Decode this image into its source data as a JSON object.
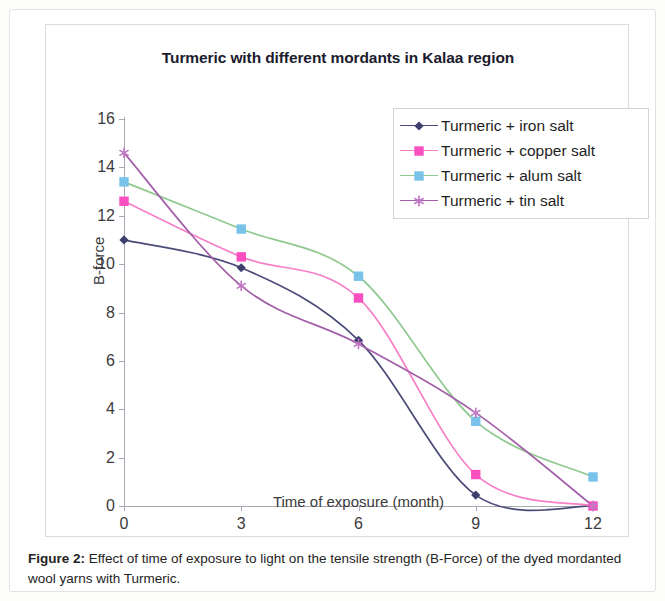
{
  "figure": {
    "caption_label": "Figure 2:",
    "caption_text": " Effect of time of exposure to light on the tensile strength (B-Force) of the dyed mordanted wool yarns with Turmeric."
  },
  "chart_data": {
    "type": "line",
    "title": "Turmeric with different mordants in Kalaa region",
    "xlabel": "Time of exposure (month)",
    "ylabel": "B-force",
    "x": [
      0,
      3,
      6,
      9,
      12
    ],
    "xticks": [
      "0",
      "3",
      "6",
      "9",
      "12"
    ],
    "yticks": [
      "0",
      "2",
      "4",
      "6",
      "8",
      "10",
      "12",
      "14",
      "16"
    ],
    "xlim": [
      0,
      12
    ],
    "ylim": [
      0,
      16
    ],
    "grid": false,
    "legend_position": "top-right-inside",
    "series": [
      {
        "name": "Turmeric + iron salt",
        "color": "#4a4a78",
        "marker": "diamond",
        "marker_color": "#3f3f6e",
        "values": [
          11.0,
          9.85,
          6.85,
          0.45,
          0.0
        ]
      },
      {
        "name": "Turmeric + copper salt",
        "color": "#f77fc8",
        "marker": "square",
        "marker_color": "#fa4fbe",
        "values": [
          12.6,
          10.3,
          8.6,
          1.3,
          0.0
        ]
      },
      {
        "name": "Turmeric + alum salt",
        "color": "#8fc98f",
        "marker": "square",
        "marker_color": "#79c3ea",
        "values": [
          13.4,
          11.45,
          9.5,
          3.5,
          1.2
        ]
      },
      {
        "name": "Turmeric + tin salt",
        "color": "#a35fa8",
        "marker": "star",
        "marker_color": "#c178c4",
        "values": [
          14.6,
          9.1,
          6.7,
          3.85,
          0.0
        ]
      }
    ]
  }
}
